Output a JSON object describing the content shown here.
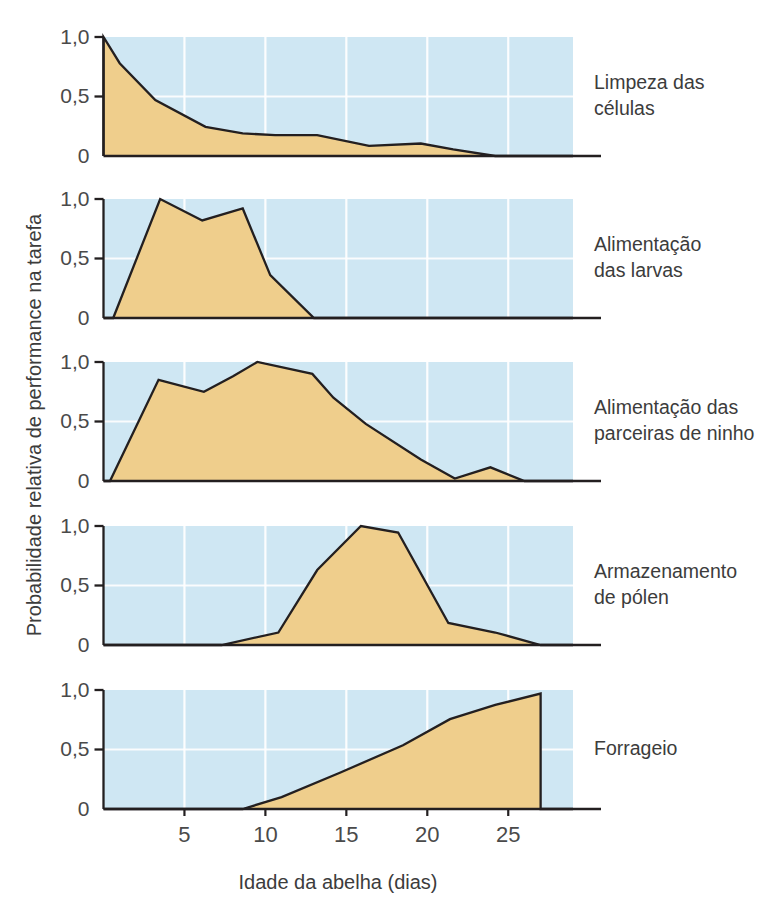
{
  "chart_data": {
    "type": "area",
    "title": "",
    "xlabel": "Idade da abelha (dias)",
    "ylabel": "Probabilidade relativa de performance na tarefa",
    "xlim": [
      0,
      29
    ],
    "ylim": [
      0,
      1.08
    ],
    "xticks": [
      5,
      10,
      15,
      20,
      25
    ],
    "xtick_labels": [
      "5",
      "10",
      "15",
      "20",
      "25"
    ],
    "yticks": [
      0,
      0.5,
      1.0
    ],
    "ytick_labels": [
      "0",
      "0,5",
      "1,0"
    ],
    "grid": true,
    "grid_color": "#ffffff",
    "panel_background": "#cfe7f3",
    "area_fill": "#efce8c",
    "line_color": "#231f20",
    "legend_position": "right",
    "panels": [
      {
        "label": "Limpeza das células",
        "label_lines": [
          "Limpeza das",
          "células"
        ],
        "x": [
          0,
          0,
          1,
          3.2,
          6.3,
          8.6,
          10.6,
          13.2,
          16.4,
          19.6,
          21.6,
          24.2,
          29
        ],
        "y": [
          0,
          1.0,
          0.78,
          0.47,
          0.245,
          0.19,
          0.175,
          0.175,
          0.085,
          0.105,
          0.055,
          0.0,
          0.0
        ]
      },
      {
        "label": "Alimentação das larvas",
        "label_lines": [
          "Alimentação",
          "das larvas"
        ],
        "x": [
          0,
          0.6,
          3.5,
          6.1,
          8.6,
          10.3,
          13.0,
          29
        ],
        "y": [
          0,
          0.0,
          1.0,
          0.82,
          0.92,
          0.36,
          0.0,
          0.0
        ]
      },
      {
        "label": "Alimentação das parceiras de ninho",
        "label_lines": [
          "Alimentação das",
          "parceiras de ninho"
        ],
        "x": [
          0,
          0.4,
          3.4,
          6.2,
          8.0,
          9.5,
          12.9,
          14.2,
          16.2,
          19.6,
          21.7,
          23.9,
          26.0,
          29
        ],
        "y": [
          0,
          0.0,
          0.85,
          0.75,
          0.88,
          1.0,
          0.9,
          0.7,
          0.48,
          0.18,
          0.02,
          0.115,
          0.0,
          0.0
        ]
      },
      {
        "label": "Armazenamento de pólen",
        "label_lines": [
          "Armazenamento",
          "de pólen"
        ],
        "x": [
          0,
          7.3,
          10.8,
          13.2,
          15.9,
          18.2,
          21.3,
          24.2,
          27.0,
          29
        ],
        "y": [
          0,
          0.0,
          0.105,
          0.63,
          1.0,
          0.945,
          0.185,
          0.105,
          0.0,
          0.0
        ]
      },
      {
        "label": "Forrageio",
        "label_lines": [
          "Forrageio"
        ],
        "x": [
          0,
          8.6,
          11.0,
          14.6,
          18.5,
          21.4,
          24.2,
          27.0,
          27.0,
          29
        ],
        "y": [
          0,
          0.0,
          0.1,
          0.305,
          0.535,
          0.755,
          0.875,
          0.97,
          0.0,
          0.0
        ]
      }
    ]
  },
  "axes": {
    "x_title": "Idade da abelha (dias)",
    "y_title": "Probabilidade relativa de performance na tarefa"
  }
}
